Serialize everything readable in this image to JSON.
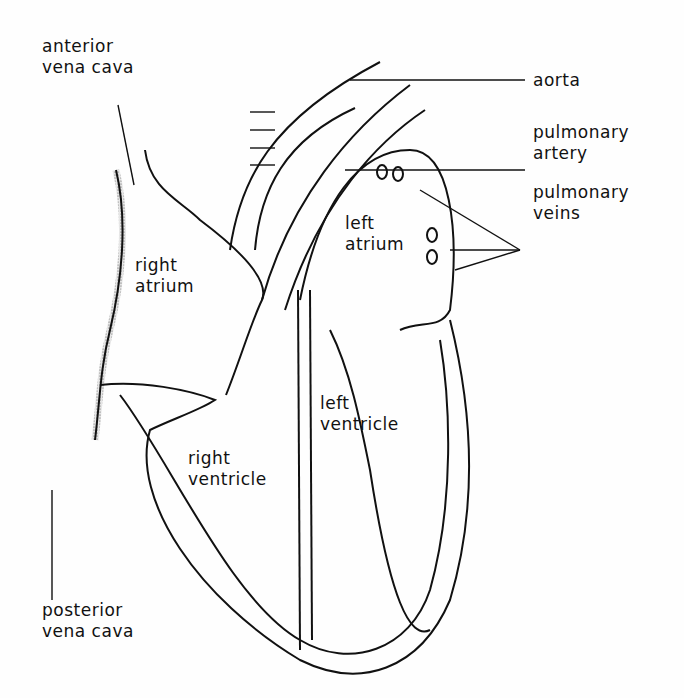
{
  "diagram": {
    "labels": {
      "anterior_vena_cava": [
        "anterior",
        "vena cava"
      ],
      "aorta": "aorta",
      "pulmonary_artery": [
        "pulmonary",
        "artery"
      ],
      "pulmonary_veins": [
        "pulmonary",
        "veins"
      ],
      "left_atrium": [
        "left",
        "atrium"
      ],
      "right_atrium": [
        "right",
        "atrium"
      ],
      "left_ventricle": [
        "left",
        "ventricle"
      ],
      "right_ventricle": [
        "right",
        "ventricle"
      ],
      "posterior_vena_cava": [
        "posterior",
        "vena cava"
      ]
    },
    "colors": {
      "line": "#111111",
      "fill": "#d8d8d8",
      "background": "#fefefe"
    }
  }
}
